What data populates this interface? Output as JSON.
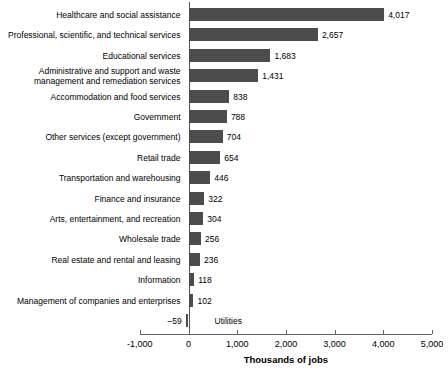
{
  "chart_data": {
    "type": "bar",
    "orientation": "horizontal",
    "title": "",
    "xlabel": "Thousands of jobs",
    "ylabel": "",
    "xlim": [
      -1000,
      5000
    ],
    "xticks": [
      "-1,000",
      "0",
      "1,000",
      "2,000",
      "3,000",
      "4,000",
      "5,000"
    ],
    "xtick_values": [
      -1000,
      0,
      1000,
      2000,
      3000,
      4000,
      5000
    ],
    "grid": false,
    "legend": "none",
    "bar_color": "#4c4c4c",
    "categories": [
      "Healthcare and social assistance",
      "Professional, scientific, and technical services",
      "Educational services",
      "Administrative and support and waste\nmanagement and remediation services",
      "Accommodation and food services",
      "Government",
      "Other services (except government)",
      "Retail trade",
      "Transportation and warehousing",
      "Finance and insurance",
      "Arts, entertainment, and recreation",
      "Wholesale trade",
      "Real estate and rental and leasing",
      "Information",
      "Management of companies and enterprises",
      "Utilities"
    ],
    "values": [
      4017,
      2657,
      1683,
      1431,
      838,
      788,
      704,
      654,
      446,
      322,
      304,
      256,
      236,
      118,
      102,
      -59
    ],
    "value_labels": [
      "4,017",
      "2,657",
      "1,683",
      "1,431",
      "838",
      "788",
      "704",
      "654",
      "446",
      "322",
      "304",
      "256",
      "236",
      "118",
      "102",
      "–59"
    ]
  }
}
